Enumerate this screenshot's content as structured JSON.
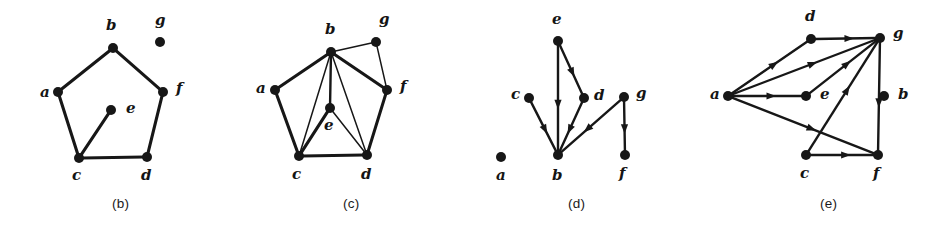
{
  "figure": {
    "kind": "graph-theory-figure",
    "background_color": "#ffffff",
    "ink_color": "#171717",
    "panel_count": 4
  },
  "panels": [
    {
      "id": "panel-b",
      "caption": "(b)",
      "caption_x": 112,
      "caption_y": 196,
      "origin_x": 0,
      "width": 230,
      "directed": false,
      "vertices": [
        {
          "id": "a",
          "label": "a",
          "x": 58,
          "y": 92,
          "label_x": 40,
          "label_y": 97
        },
        {
          "id": "b",
          "label": "b",
          "x": 113,
          "y": 48,
          "label_x": 106,
          "label_y": 30
        },
        {
          "id": "c",
          "label": "c",
          "x": 79,
          "y": 158,
          "label_x": 72,
          "label_y": 180
        },
        {
          "id": "d",
          "label": "d",
          "x": 147,
          "y": 157,
          "label_x": 141,
          "label_y": 180
        },
        {
          "id": "e",
          "label": "e",
          "x": 111,
          "y": 110,
          "label_x": 126,
          "label_y": 113
        },
        {
          "id": "f",
          "label": "f",
          "x": 163,
          "y": 92,
          "label_x": 176,
          "label_y": 93
        },
        {
          "id": "g",
          "label": "g",
          "x": 160,
          "y": 42,
          "label_x": 155,
          "label_y": 25
        }
      ],
      "edges": [
        {
          "from": "a",
          "to": "b",
          "weight": "thick"
        },
        {
          "from": "b",
          "to": "f",
          "weight": "thick"
        },
        {
          "from": "a",
          "to": "c",
          "weight": "thick"
        },
        {
          "from": "f",
          "to": "d",
          "weight": "thick"
        },
        {
          "from": "c",
          "to": "d",
          "weight": "thick"
        },
        {
          "from": "c",
          "to": "e",
          "weight": "thick"
        }
      ],
      "isolated_vertices": [
        "g"
      ]
    },
    {
      "id": "panel-c",
      "caption": "(c)",
      "caption_x": 343,
      "caption_y": 196,
      "origin_x": 230,
      "width": 230,
      "directed": false,
      "vertices": [
        {
          "id": "a",
          "label": "a",
          "x": 45,
          "y": 90,
          "label_x": 26,
          "label_y": 93
        },
        {
          "id": "b",
          "label": "b",
          "x": 101,
          "y": 52,
          "label_x": 95,
          "label_y": 34
        },
        {
          "id": "c",
          "label": "c",
          "x": 69,
          "y": 156,
          "label_x": 62,
          "label_y": 179
        },
        {
          "id": "d",
          "label": "d",
          "x": 137,
          "y": 155,
          "label_x": 131,
          "label_y": 179
        },
        {
          "id": "e",
          "label": "e",
          "x": 100,
          "y": 108,
          "label_x": 94,
          "label_y": 130
        },
        {
          "id": "f",
          "label": "f",
          "x": 157,
          "y": 90,
          "label_x": 170,
          "label_y": 91
        },
        {
          "id": "g",
          "label": "g",
          "x": 146,
          "y": 42,
          "label_x": 149,
          "label_y": 24
        }
      ],
      "edges": [
        {
          "from": "a",
          "to": "b",
          "weight": "thick"
        },
        {
          "from": "b",
          "to": "g",
          "weight": "thin"
        },
        {
          "from": "b",
          "to": "f",
          "weight": "thick"
        },
        {
          "from": "b",
          "to": "c",
          "weight": "thin"
        },
        {
          "from": "b",
          "to": "e",
          "weight": "med"
        },
        {
          "from": "b",
          "to": "d",
          "weight": "thin"
        },
        {
          "from": "a",
          "to": "c",
          "weight": "thick"
        },
        {
          "from": "c",
          "to": "e",
          "weight": "thick"
        },
        {
          "from": "e",
          "to": "d",
          "weight": "thin"
        },
        {
          "from": "c",
          "to": "d",
          "weight": "thick"
        },
        {
          "from": "d",
          "to": "f",
          "weight": "thick"
        },
        {
          "from": "f",
          "to": "g",
          "weight": "thin"
        }
      ],
      "isolated_vertices": []
    },
    {
      "id": "panel-d",
      "caption": "(d)",
      "caption_x": 568,
      "caption_y": 196,
      "origin_x": 460,
      "width": 230,
      "directed": true,
      "vertices": [
        {
          "id": "a",
          "label": "a",
          "x": 41,
          "y": 157,
          "label_x": 36,
          "label_y": 180
        },
        {
          "id": "b",
          "label": "b",
          "x": 98,
          "y": 155,
          "label_x": 92,
          "label_y": 180
        },
        {
          "id": "c",
          "label": "c",
          "x": 69,
          "y": 98,
          "label_x": 51,
          "label_y": 99
        },
        {
          "id": "d",
          "label": "d",
          "x": 124,
          "y": 98,
          "label_x": 134,
          "label_y": 100
        },
        {
          "id": "e",
          "label": "e",
          "x": 98,
          "y": 41,
          "label_x": 92,
          "label_y": 24
        },
        {
          "id": "f",
          "label": "f",
          "x": 165,
          "y": 155,
          "label_x": 159,
          "label_y": 178
        },
        {
          "id": "g",
          "label": "g",
          "x": 164,
          "y": 97,
          "label_x": 176,
          "label_y": 98
        }
      ],
      "edges": [
        {
          "from": "e",
          "to": "b",
          "weight": "med",
          "directed": true
        },
        {
          "from": "e",
          "to": "d",
          "weight": "med",
          "directed": true
        },
        {
          "from": "d",
          "to": "b",
          "weight": "med",
          "directed": true
        },
        {
          "from": "c",
          "to": "b",
          "weight": "med",
          "directed": true
        },
        {
          "from": "g",
          "to": "b",
          "weight": "med",
          "directed": true
        },
        {
          "from": "g",
          "to": "f",
          "weight": "med",
          "directed": true
        }
      ],
      "isolated_vertices": [
        "a"
      ]
    },
    {
      "id": "panel-e",
      "caption": "(e)",
      "caption_x": 820,
      "caption_y": 196,
      "origin_x": 690,
      "width": 261,
      "directed": true,
      "vertices": [
        {
          "id": "a",
          "label": "a",
          "x": 38,
          "y": 96,
          "label_x": 20,
          "label_y": 99
        },
        {
          "id": "b",
          "label": "b",
          "x": 194,
          "y": 96,
          "label_x": 208,
          "label_y": 99
        },
        {
          "id": "c",
          "label": "c",
          "x": 116,
          "y": 155,
          "label_x": 110,
          "label_y": 178
        },
        {
          "id": "d",
          "label": "d",
          "x": 121,
          "y": 39,
          "label_x": 115,
          "label_y": 21
        },
        {
          "id": "e",
          "label": "e",
          "x": 116,
          "y": 96,
          "label_x": 130,
          "label_y": 99
        },
        {
          "id": "f",
          "label": "f",
          "x": 188,
          "y": 155,
          "label_x": 183,
          "label_y": 178
        },
        {
          "id": "g",
          "label": "g",
          "x": 190,
          "y": 38,
          "label_x": 203,
          "label_y": 38
        }
      ],
      "edges": [
        {
          "from": "a",
          "to": "d",
          "weight": "med",
          "directed": true
        },
        {
          "from": "a",
          "to": "g",
          "weight": "med",
          "directed": true
        },
        {
          "from": "a",
          "to": "e",
          "weight": "med",
          "directed": true
        },
        {
          "from": "a",
          "to": "f",
          "weight": "med",
          "directed": true
        },
        {
          "from": "d",
          "to": "g",
          "weight": "med",
          "directed": true
        },
        {
          "from": "e",
          "to": "g",
          "weight": "med",
          "directed": true
        },
        {
          "from": "c",
          "to": "g",
          "weight": "med",
          "directed": true
        },
        {
          "from": "c",
          "to": "f",
          "weight": "med",
          "directed": true
        },
        {
          "from": "g",
          "to": "f",
          "weight": "med",
          "directed": true
        }
      ],
      "isolated_vertices": [
        "b"
      ]
    }
  ]
}
